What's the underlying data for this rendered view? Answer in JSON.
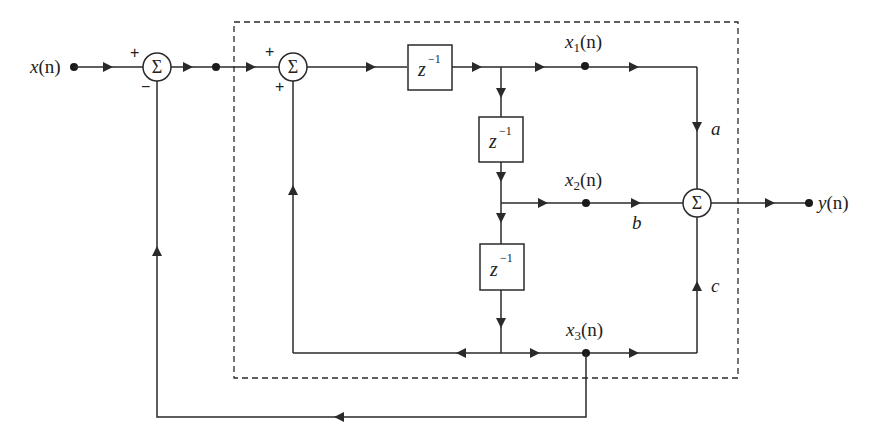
{
  "diagram": {
    "type": "signal-flow block diagram",
    "input": {
      "label": "x(n)",
      "var": "x",
      "arg": "(n)"
    },
    "output": {
      "label": "y(n)",
      "var": "y",
      "arg": "(n)"
    },
    "summers": [
      {
        "id": "sum1",
        "symbol": "Σ",
        "signs": [
          "+",
          "−"
        ]
      },
      {
        "id": "sum2",
        "symbol": "Σ",
        "signs": [
          "+",
          "+"
        ]
      },
      {
        "id": "sum_out",
        "symbol": "Σ",
        "signs": []
      }
    ],
    "delays": [
      {
        "id": "delay1",
        "base": "z",
        "exp": "−1"
      },
      {
        "id": "delay2",
        "base": "z",
        "exp": "−1"
      },
      {
        "id": "delay3",
        "base": "z",
        "exp": "−1"
      }
    ],
    "states": [
      {
        "id": "x1",
        "var": "x",
        "sub": "1",
        "arg": "(n)"
      },
      {
        "id": "x2",
        "var": "x",
        "sub": "2",
        "arg": "(n)"
      },
      {
        "id": "x3",
        "var": "x",
        "sub": "3",
        "arg": "(n)"
      }
    ],
    "gains": {
      "a": "a",
      "b": "b",
      "c": "c"
    },
    "subsystem_boundary": "dashed rectangle"
  }
}
